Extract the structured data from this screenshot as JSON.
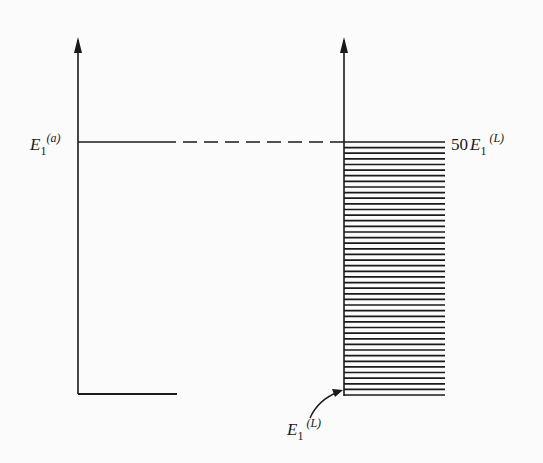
{
  "diagram": {
    "colors": {
      "ink": "#1a1a1a",
      "background": "#fbfbfb"
    },
    "left_panel": {
      "level_label": {
        "main": "E",
        "sub": "1",
        "sup": "(a)"
      }
    },
    "right_panel": {
      "top_label": {
        "prefix": "50",
        "main": "E",
        "sub": "1",
        "sup": "(L)"
      },
      "bottom_label": {
        "main": "E",
        "sub": "1",
        "sup": "(L)"
      },
      "band_line_count": 46
    }
  }
}
